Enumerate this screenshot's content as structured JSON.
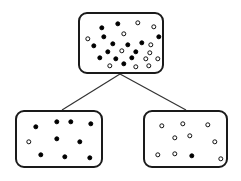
{
  "diagram": {
    "type": "decision-tree-split",
    "canvas": {
      "width": 241,
      "height": 181
    },
    "colors": {
      "background": "#ffffff",
      "box_stroke": "#1a1a1a",
      "edge_stroke": "#333333",
      "filled_dot": "#000000",
      "hollow_dot_fill": "#ffffff",
      "hollow_dot_stroke": "#111111"
    },
    "dot_legend": [
      {
        "key": "filled",
        "label": "filled circle",
        "meaning": "class A sample"
      },
      {
        "key": "hollow",
        "label": "hollow circle",
        "meaning": "class B sample"
      }
    ],
    "nodes": [
      {
        "id": "root",
        "name": "root-node",
        "label": "",
        "box": {
          "x": 78,
          "y": 12,
          "width": 86,
          "height": 62
        },
        "counts": {
          "filled": 14,
          "hollow": 12,
          "total": 26
        },
        "dots": [
          {
            "x": 22,
            "y": 14,
            "type": "filled"
          },
          {
            "x": 38,
            "y": 10,
            "type": "filled"
          },
          {
            "x": 58,
            "y": 9,
            "type": "hollow"
          },
          {
            "x": 74,
            "y": 13,
            "type": "hollow"
          },
          {
            "x": 8,
            "y": 25,
            "type": "hollow"
          },
          {
            "x": 24,
            "y": 23,
            "type": "filled"
          },
          {
            "x": 44,
            "y": 20,
            "type": "hollow"
          },
          {
            "x": 79,
            "y": 23,
            "type": "filled"
          },
          {
            "x": 14,
            "y": 32,
            "type": "filled"
          },
          {
            "x": 33,
            "y": 30,
            "type": "filled"
          },
          {
            "x": 48,
            "y": 31,
            "type": "filled"
          },
          {
            "x": 62,
            "y": 29,
            "type": "filled"
          },
          {
            "x": 71,
            "y": 31,
            "type": "hollow"
          },
          {
            "x": 28,
            "y": 38,
            "type": "filled"
          },
          {
            "x": 42,
            "y": 37,
            "type": "hollow"
          },
          {
            "x": 56,
            "y": 38,
            "type": "filled"
          },
          {
            "x": 70,
            "y": 39,
            "type": "hollow"
          },
          {
            "x": 20,
            "y": 44,
            "type": "filled"
          },
          {
            "x": 36,
            "y": 45,
            "type": "filled"
          },
          {
            "x": 52,
            "y": 44,
            "type": "filled"
          },
          {
            "x": 66,
            "y": 45,
            "type": "hollow"
          },
          {
            "x": 30,
            "y": 52,
            "type": "hollow"
          },
          {
            "x": 44,
            "y": 50,
            "type": "filled"
          },
          {
            "x": 56,
            "y": 53,
            "type": "hollow"
          },
          {
            "x": 69,
            "y": 52,
            "type": "hollow"
          },
          {
            "x": 78,
            "y": 45,
            "type": "hollow"
          }
        ]
      },
      {
        "id": "left",
        "name": "left-child-node",
        "label": "",
        "box": {
          "x": 15,
          "y": 110,
          "width": 88,
          "height": 58
        },
        "counts": {
          "filled": 9,
          "hollow": 1,
          "total": 10
        },
        "dots": [
          {
            "x": 19,
            "y": 15,
            "type": "filled"
          },
          {
            "x": 40,
            "y": 10,
            "type": "filled"
          },
          {
            "x": 54,
            "y": 10,
            "type": "filled"
          },
          {
            "x": 74,
            "y": 12,
            "type": "filled"
          },
          {
            "x": 12,
            "y": 30,
            "type": "hollow"
          },
          {
            "x": 40,
            "y": 27,
            "type": "filled"
          },
          {
            "x": 63,
            "y": 30,
            "type": "filled"
          },
          {
            "x": 24,
            "y": 43,
            "type": "filled"
          },
          {
            "x": 48,
            "y": 45,
            "type": "filled"
          },
          {
            "x": 73,
            "y": 46,
            "type": "filled"
          }
        ]
      },
      {
        "id": "right",
        "name": "right-child-node",
        "label": "",
        "box": {
          "x": 143,
          "y": 110,
          "width": 85,
          "height": 58
        },
        "counts": {
          "filled": 1,
          "hollow": 9,
          "total": 10
        },
        "dots": [
          {
            "x": 17,
            "y": 14,
            "type": "hollow"
          },
          {
            "x": 38,
            "y": 12,
            "type": "hollow"
          },
          {
            "x": 63,
            "y": 13,
            "type": "hollow"
          },
          {
            "x": 30,
            "y": 26,
            "type": "hollow"
          },
          {
            "x": 45,
            "y": 24,
            "type": "hollow"
          },
          {
            "x": 70,
            "y": 30,
            "type": "hollow"
          },
          {
            "x": 13,
            "y": 43,
            "type": "hollow"
          },
          {
            "x": 30,
            "y": 42,
            "type": "hollow"
          },
          {
            "x": 47,
            "y": 44,
            "type": "filled"
          },
          {
            "x": 76,
            "y": 47,
            "type": "hollow"
          }
        ]
      }
    ],
    "edges": [
      {
        "id": "root-to-left",
        "name": "edge-root-to-left-child",
        "from": "root",
        "to": "left",
        "x1": 120,
        "y1": 74,
        "x2": 62,
        "y2": 110
      },
      {
        "id": "root-to-right",
        "name": "edge-root-to-right-child",
        "from": "root",
        "to": "right",
        "x1": 120,
        "y1": 74,
        "x2": 186,
        "y2": 110
      }
    ]
  }
}
